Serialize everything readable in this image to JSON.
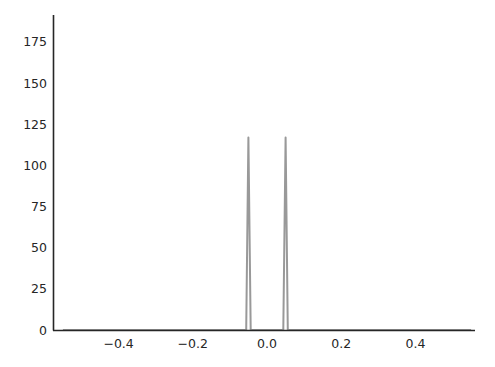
{
  "chart_data": {
    "type": "line",
    "title": "",
    "xlabel": "",
    "ylabel": "",
    "xlim": [
      -0.55,
      0.55
    ],
    "ylim": [
      0,
      190
    ],
    "x_ticks": [
      -0.4,
      -0.2,
      0.0,
      0.2,
      0.4
    ],
    "x_tick_labels": [
      "−0.4",
      "−0.2",
      "0.0",
      "0.2",
      "0.4"
    ],
    "y_ticks": [
      0,
      25,
      50,
      75,
      100,
      125,
      150,
      175
    ],
    "y_tick_labels": [
      "0",
      "25",
      "50",
      "75",
      "100",
      "125",
      "150",
      "175"
    ],
    "grid": false,
    "legend": null,
    "series": [
      {
        "name": "density",
        "color": "#999999",
        "peaks": [
          {
            "x": -0.05,
            "height": 117
          },
          {
            "x": 0.05,
            "height": 117
          }
        ],
        "x": [
          -0.55,
          -0.056,
          -0.05,
          -0.044,
          0.044,
          0.05,
          0.056,
          0.55
        ],
        "y": [
          0,
          0,
          117,
          0,
          0,
          117,
          0,
          0
        ]
      }
    ]
  }
}
